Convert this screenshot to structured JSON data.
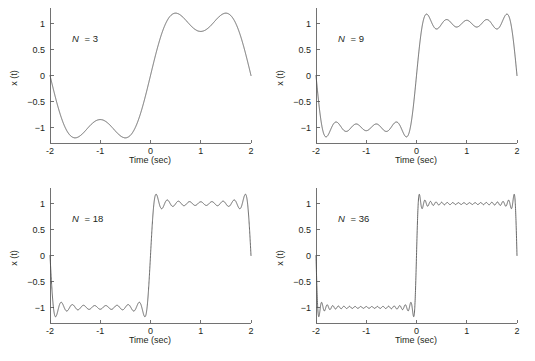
{
  "figure": {
    "background_color": "#ffffff",
    "curve_color": "#4d4d4d",
    "axis_color": "#636363",
    "text_color": "#231f20",
    "layout": "2x2 grid of line plots"
  },
  "panels": [
    {
      "id": "panel-n3",
      "annotation": "N = 3",
      "annotation_symbol": "N",
      "annotation_value": "3",
      "xlabel": "Time (sec)",
      "ylabel": "x (t)",
      "xticks": [
        "-2",
        "-1",
        "0",
        "1",
        "2"
      ],
      "yticks": [
        "1",
        "0.5",
        "0",
        "-0.5",
        "-1"
      ]
    },
    {
      "id": "panel-n9",
      "annotation": "N = 9",
      "annotation_symbol": "N",
      "annotation_value": "9",
      "xlabel": "Time (sec)",
      "ylabel": "x (t)",
      "xticks": [
        "-2",
        "-1",
        "0",
        "1",
        "2"
      ],
      "yticks": [
        "1",
        "0.5",
        "0",
        "-0.5",
        "-1"
      ]
    },
    {
      "id": "panel-n18",
      "annotation": "N = 18",
      "annotation_symbol": "N",
      "annotation_value": "18",
      "xlabel": "Time (sec)",
      "ylabel": "x (t)",
      "xticks": [
        "-2",
        "-1",
        "0",
        "1",
        "2"
      ],
      "yticks": [
        "1",
        "0.5",
        "0",
        "-0.5",
        "-1"
      ]
    },
    {
      "id": "panel-n36",
      "annotation": "N = 36",
      "annotation_symbol": "N",
      "annotation_value": "36",
      "xlabel": "Time (sec)",
      "ylabel": "x (t)",
      "xticks": [
        "-2",
        "-1",
        "0",
        "1",
        "2"
      ],
      "yticks": [
        "1",
        "0.5",
        "0",
        "-0.5",
        "-1"
      ]
    }
  ],
  "chart_data": [
    {
      "type": "line",
      "title": "N = 3",
      "xlabel": "Time (sec)",
      "ylabel": "x (t)",
      "xlim": [
        -2,
        2
      ],
      "ylim": [
        -1.3,
        1.3
      ],
      "xticks": [
        -2,
        -1,
        0,
        1,
        2
      ],
      "yticks": [
        -1,
        -0.5,
        0,
        0.5,
        1
      ],
      "grid": false,
      "legend": null,
      "series": [
        {
          "name": "Fourier partial sum, N = 3",
          "description": "Odd-harmonic Fourier series partial sum of a square wave of period 4 s, sum over odd k<=3 of (4/(pi*k))*sin(pi*k*t/2)",
          "harmonics": 3,
          "period_sec": 4,
          "amplitude": 1,
          "overshoot_peak": 1.18,
          "undershoot_min": -1.22
        }
      ]
    },
    {
      "type": "line",
      "title": "N = 9",
      "xlabel": "Time (sec)",
      "ylabel": "x (t)",
      "xlim": [
        -2,
        2
      ],
      "ylim": [
        -1.3,
        1.3
      ],
      "xticks": [
        -2,
        -1,
        0,
        1,
        2
      ],
      "yticks": [
        -1,
        -0.5,
        0,
        0.5,
        1
      ],
      "grid": false,
      "legend": null,
      "series": [
        {
          "name": "Fourier partial sum, N = 9",
          "description": "Odd-harmonic Fourier series partial sum of a square wave of period 4 s, sum over odd k<=9 of (4/(pi*k))*sin(pi*k*t/2)",
          "harmonics": 9,
          "period_sec": 4,
          "amplitude": 1,
          "overshoot_peak": 1.18,
          "undershoot_min": -1.2
        }
      ]
    },
    {
      "type": "line",
      "title": "N = 18",
      "xlabel": "Time (sec)",
      "ylabel": "x (t)",
      "xlim": [
        -2,
        2
      ],
      "ylim": [
        -1.3,
        1.3
      ],
      "xticks": [
        -2,
        -1,
        0,
        1,
        2
      ],
      "yticks": [
        -1,
        -0.5,
        0,
        0.5,
        1
      ],
      "grid": false,
      "legend": null,
      "series": [
        {
          "name": "Fourier partial sum, N = 18",
          "description": "Odd-harmonic Fourier series partial sum of a square wave of period 4 s, sum over odd k<=18 of (4/(pi*k))*sin(pi*k*t/2)",
          "harmonics": 18,
          "period_sec": 4,
          "amplitude": 1,
          "overshoot_peak": 1.18,
          "undershoot_min": -1.2
        }
      ]
    },
    {
      "type": "line",
      "title": "N = 36",
      "xlabel": "Time (sec)",
      "ylabel": "x (t)",
      "xlim": [
        -2,
        2
      ],
      "ylim": [
        -1.3,
        1.3
      ],
      "xticks": [
        -2,
        -1,
        0,
        1,
        2
      ],
      "yticks": [
        -1,
        -0.5,
        0,
        0.5,
        1
      ],
      "grid": false,
      "legend": null,
      "series": [
        {
          "name": "Fourier partial sum, N = 36",
          "description": "Odd-harmonic Fourier series partial sum of a square wave of period 4 s, sum over odd k<=36 of (4/(pi*k))*sin(pi*k*t/2)",
          "harmonics": 36,
          "period_sec": 4,
          "amplitude": 1,
          "overshoot_peak": 1.18,
          "undershoot_min": -1.18
        }
      ]
    }
  ]
}
